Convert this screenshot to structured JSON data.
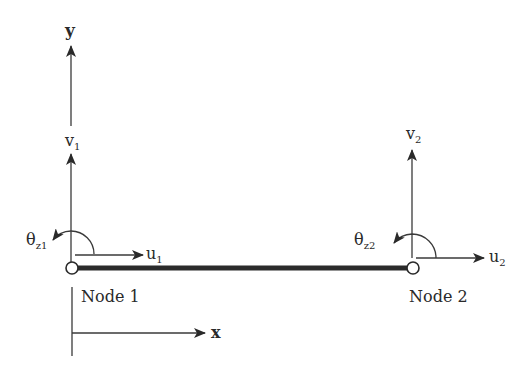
{
  "diagram": {
    "colors": {
      "line": "#3a3a3a",
      "beam": "#2b2b2b",
      "text": "#2a2a2a",
      "background": "#ffffff"
    },
    "axes": {
      "y_label": "y",
      "x_label": "x"
    },
    "node1": {
      "label": "Node 1",
      "v_label": "v",
      "v_sub": "1",
      "u_label": "u",
      "u_sub": "1",
      "theta_label": "θ",
      "theta_sub": "z1"
    },
    "node2": {
      "label": "Node 2",
      "v_label": "v",
      "v_sub": "2",
      "u_label": "u",
      "u_sub": "2",
      "theta_label": "θ",
      "theta_sub": "z2"
    }
  }
}
